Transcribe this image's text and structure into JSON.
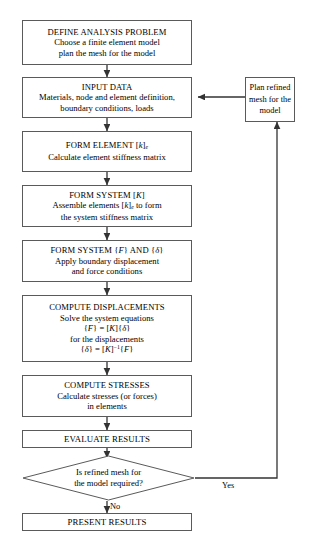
{
  "diagram": {
    "type": "flowchart",
    "title_top_partial": "",
    "caption_bottom_partial": "",
    "accent_line_color": "#404040",
    "box_border_color": "#5a5a5a",
    "background_color": "#ffffff"
  },
  "nodes": {
    "define": {
      "title": "DEFINE ANALYSIS PROBLEM",
      "line2": "Choose a finite element model",
      "line3": "plan the mesh for the model"
    },
    "input": {
      "title": "INPUT DATA",
      "line2": "Materials, node and element definition,",
      "line3": "boundary conditions, loads"
    },
    "form_element": {
      "title_pre": "FORM ELEMENT [",
      "title_var": "k",
      "title_post": "]",
      "title_sub": "e",
      "line2": "Calculate element stiffness matrix"
    },
    "form_system_k": {
      "title_pre": "FORM SYSTEM [",
      "title_var": "K",
      "title_post": "]",
      "line2_pre": "Assemble elements [",
      "line2_var": "k",
      "line2_post": "]",
      "line2_sub": "e",
      "line2_tail": " to form",
      "line3": "the system stiffness matrix"
    },
    "form_system_fd": {
      "title_pre": "FORM SYSTEM {",
      "title_var1": "F",
      "title_mid": "} AND {",
      "title_var2": "δ",
      "title_post": "}",
      "line2": "Apply boundary displacement",
      "line3": "and force conditions"
    },
    "compute_disp": {
      "title": "COMPUTE DISPLACEMENTS",
      "line2": "Solve the system equations",
      "eq1_a": "{",
      "eq1_f": "F",
      "eq1_b": "} = [",
      "eq1_k": "K",
      "eq1_c": "]{",
      "eq1_d": "δ",
      "eq1_e": "}",
      "line4": "for the displacements",
      "eq2_a": "{",
      "eq2_d": "δ",
      "eq2_b": "} = [",
      "eq2_k": "K",
      "eq2_c": "]",
      "eq2_sup": "−1",
      "eq2_e": "{",
      "eq2_f": "F",
      "eq2_g": "}"
    },
    "compute_stress": {
      "title": "COMPUTE STRESSES",
      "line2": "Calculate stresses (or forces)",
      "line3": "in elements"
    },
    "evaluate": {
      "title": "EVALUATE RESULTS"
    },
    "decision": {
      "line1": "Is refined mesh for",
      "line2": "the model required?"
    },
    "present": {
      "title": "PRESENT RESULTS"
    },
    "plan_refined": {
      "line1": "Plan refined",
      "line2": "mesh for the",
      "line3": "model"
    }
  },
  "edge_labels": {
    "yes": "Yes",
    "no": "No"
  }
}
